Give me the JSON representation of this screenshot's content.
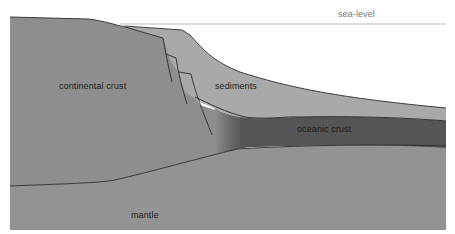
{
  "diagram": {
    "type": "geological cross-section",
    "labels": {
      "sea_level": "sea-level",
      "continental_crust": "continental crust",
      "sediments": "sediments",
      "oceanic_crust": "oceanic crust",
      "mantle": "mantle"
    },
    "colors": {
      "continental_crust": "#8e8e8e",
      "sediments": "#a9a9a9",
      "oceanic_crust": "#555555",
      "mantle": "#939393",
      "lines": "#2b2b2b",
      "sea_level_line": "#bdbdbd",
      "background": "#ffffff"
    }
  }
}
